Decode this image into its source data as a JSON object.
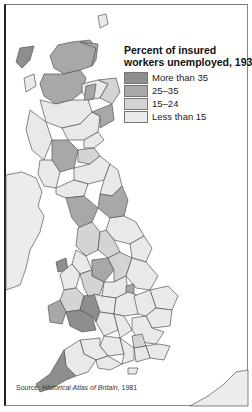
{
  "legend": {
    "title_line1": "Percent of insured",
    "title_line2": "workers unemployed, 1932",
    "items": [
      {
        "label": "More than 35",
        "color": "#8e8e8e"
      },
      {
        "label": "25–35",
        "color": "#a8a8a8"
      },
      {
        "label": "15–24",
        "color": "#d4d4d4"
      },
      {
        "label": "Less than 15",
        "color": "#e9e9e9"
      }
    ]
  },
  "source": {
    "prefix": "Source: ",
    "title": "Historical Atlas of Britain,",
    "year": " 1981"
  },
  "colors": {
    "border": "#555555",
    "sea": "#ffffff",
    "ireland": "#ececec",
    "france": "#ececec"
  }
}
